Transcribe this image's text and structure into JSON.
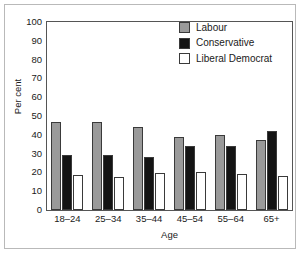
{
  "chart_data": {
    "type": "bar",
    "title": "",
    "xlabel": "Age",
    "ylabel": "Per cent",
    "ylim": [
      0,
      100
    ],
    "yticks": [
      0,
      10,
      20,
      30,
      40,
      50,
      60,
      70,
      80,
      90,
      100
    ],
    "grid": false,
    "legend_position": "top-right",
    "categories": [
      "18–24",
      "25–34",
      "35–44",
      "45–54",
      "55–64",
      "65+"
    ],
    "series": [
      {
        "name": "Labour",
        "color": "#9a9a9a",
        "values": [
          47,
          47,
          44,
          39,
          40,
          37
        ]
      },
      {
        "name": "Conservative",
        "color": "#141414",
        "values": [
          29,
          29,
          28,
          34,
          34,
          42
        ]
      },
      {
        "name": "Liberal Democrat",
        "color": "#ffffff",
        "values": [
          18.5,
          17.5,
          19.5,
          20,
          19,
          18
        ]
      }
    ]
  }
}
